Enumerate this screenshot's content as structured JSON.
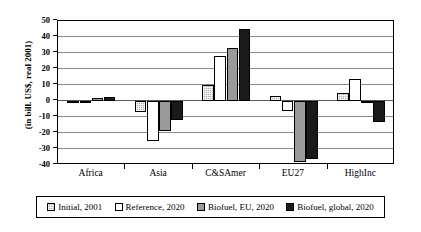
{
  "chart_data": {
    "type": "bar",
    "title": "",
    "subtitle": "",
    "xlabel": "",
    "ylabel": "(in bill. US$, real 2001)",
    "categories": [
      "Africa",
      "Asia",
      "C&SAmer",
      "EU27",
      "HighInc"
    ],
    "series": [
      {
        "name": "Initial, 2001",
        "key": "sw-initial",
        "color": "#b0b0b0",
        "pattern": "checkered",
        "values": [
          -0.5,
          -7,
          10,
          3,
          5
        ]
      },
      {
        "name": "Reference, 2020",
        "key": "sw-reference",
        "color": "#ffffff",
        "pattern": "solid",
        "values": [
          -0.5,
          -25,
          28,
          -6,
          14
        ]
      },
      {
        "name": "Biofuel, EU, 2020",
        "key": "sw-biofuel-eu",
        "color": "#9a9a9a",
        "pattern": "solid",
        "values": [
          2,
          -19,
          33,
          -38,
          0
        ]
      },
      {
        "name": "Biofuel, global, 2020",
        "key": "sw-biofuel-global",
        "color": "#1a1a1a",
        "pattern": "solid",
        "values": [
          2.5,
          -12,
          45,
          -36,
          -13
        ]
      }
    ],
    "ylim": [
      -40,
      50
    ],
    "yticks": [
      50,
      40,
      30,
      20,
      10,
      0,
      -10,
      -20,
      -30,
      -40
    ],
    "ytick_labels": [
      "50",
      "40",
      "30",
      "20",
      "10",
      "0",
      "-10",
      "-20",
      "-30",
      "-40"
    ],
    "grid": true,
    "legend_position": "bottom"
  }
}
